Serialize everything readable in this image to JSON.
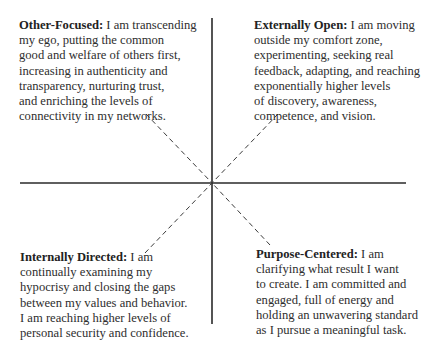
{
  "diagram": {
    "type": "quadrant",
    "axes": {
      "vertical": {
        "x": 212,
        "y1": 18,
        "y2": 324
      },
      "horizontal": {
        "y": 183,
        "x1": 20,
        "x2": 406
      },
      "color": "#2a2a2a"
    },
    "connectors": {
      "style": "dashed",
      "color": "#3a3a3a",
      "nw": {
        "x1": 146,
        "y1": 114,
        "x2": 212,
        "y2": 183
      },
      "ne": {
        "x1": 278,
        "y1": 114,
        "x2": 212,
        "y2": 183
      },
      "sw": {
        "x1": 145,
        "y1": 253,
        "x2": 212,
        "y2": 183
      },
      "se": {
        "x1": 270,
        "y1": 245,
        "x2": 212,
        "y2": 183
      }
    },
    "quadrants": {
      "nw": {
        "title": "Other-Focused:",
        "lines": [
          " I am transcending",
          "my ego, putting the common",
          "good and welfare of others first,",
          "increasing in authenticity and",
          "transparency, nurturing trust,",
          "and enriching the levels of",
          "connectivity in my networks."
        ]
      },
      "ne": {
        "title": "Externally Open:",
        "lines": [
          " I am moving",
          "outside my comfort zone,",
          "experimenting, seeking real",
          "feedback, adapting, and reaching",
          "exponentially higher levels",
          "of discovery, awareness,",
          "competence, and vision."
        ]
      },
      "sw": {
        "title": "Internally Directed:",
        "lines": [
          " I am",
          "continually examining my",
          "hypocrisy and closing the gaps",
          "between my values and behavior.",
          "I am reaching higher levels of",
          "personal security and confidence."
        ]
      },
      "se": {
        "title": "Purpose-Centered:",
        "lines": [
          " I am",
          "clarifying what result I want",
          "to create. I am committed and",
          "engaged, full of energy and",
          "holding an unwavering standard",
          "as I pursue a meaningful task."
        ]
      }
    }
  }
}
